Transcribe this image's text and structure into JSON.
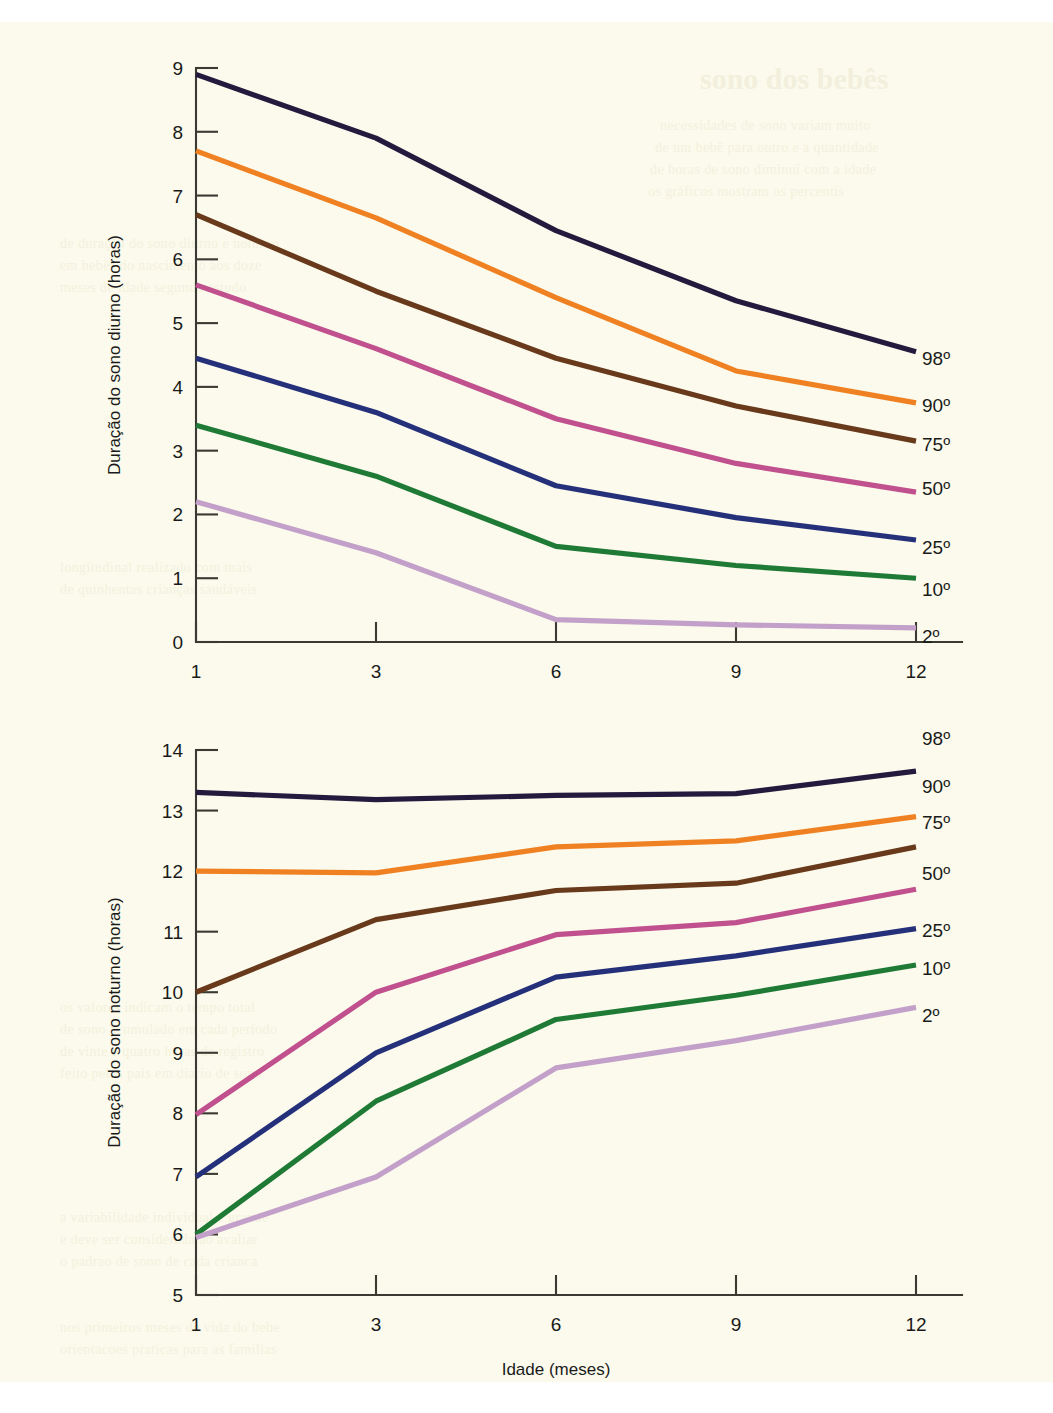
{
  "page": {
    "background_color": "#fbfaec",
    "ghost_text": [
      {
        "text": "sono dos bebês",
        "x": 700,
        "y": 62,
        "size": "big"
      },
      {
        "text": "necessidades de sono variam muito",
        "x": 660,
        "y": 118,
        "size": "body"
      },
      {
        "text": "de um bebê para outro e a quantidade",
        "x": 655,
        "y": 140,
        "size": "body"
      },
      {
        "text": "de horas de sono diminui com a idade",
        "x": 650,
        "y": 162,
        "size": "body"
      },
      {
        "text": "os gráficos mostram os percentis",
        "x": 648,
        "y": 184,
        "size": "body"
      },
      {
        "text": "de duração do sono diurno e noturno",
        "x": 60,
        "y": 236,
        "size": "body"
      },
      {
        "text": "em bebês do nascimento aos doze",
        "x": 60,
        "y": 258,
        "size": "body"
      },
      {
        "text": "meses de idade segundo estudo",
        "x": 60,
        "y": 280,
        "size": "body"
      },
      {
        "text": "longitudinal realizado com mais",
        "x": 60,
        "y": 560,
        "size": "body"
      },
      {
        "text": "de quinhentas crianças saudáveis",
        "x": 60,
        "y": 582,
        "size": "body"
      },
      {
        "text": "os valores indicam o tempo total",
        "x": 60,
        "y": 1000,
        "size": "body"
      },
      {
        "text": "de sono acumulado em cada período",
        "x": 60,
        "y": 1022,
        "size": "body"
      },
      {
        "text": "de vinte e quatro horas de registro",
        "x": 60,
        "y": 1044,
        "size": "body"
      },
      {
        "text": "feito pelos pais em diario de sono",
        "x": 60,
        "y": 1066,
        "size": "body"
      },
      {
        "text": "a variabilidade individual e grande",
        "x": 60,
        "y": 1210,
        "size": "body"
      },
      {
        "text": "e deve ser considerada ao avaliar",
        "x": 60,
        "y": 1232,
        "size": "body"
      },
      {
        "text": "o padrao de sono de cada crianca",
        "x": 60,
        "y": 1254,
        "size": "body"
      },
      {
        "text": "nos primeiros meses de vida do bebe",
        "x": 60,
        "y": 1320,
        "size": "body"
      },
      {
        "text": "orientacoes praticas para as familias",
        "x": 60,
        "y": 1342,
        "size": "body"
      }
    ]
  },
  "colors": {
    "p98": "#241a3e",
    "p90": "#ef8122",
    "p75": "#68391a",
    "p50": "#c0508e",
    "p25": "#25307a",
    "p10": "#1f7a36",
    "p2": "#c3a0c9",
    "axis": "#3a3a32",
    "text": "#1a1a1a"
  },
  "chart_data": [
    {
      "id": "sono-diurno",
      "type": "line",
      "title": "",
      "xlabel": "Idade (meses)",
      "ylabel": "Duração do sono diurno (horas)",
      "categories": [
        "1",
        "3",
        "6",
        "9",
        "12"
      ],
      "x": [
        1,
        3,
        6,
        9,
        12
      ],
      "xticklabels": [
        "1",
        "3",
        "6",
        "9",
        "12"
      ],
      "yticklabels": [
        "0",
        "1",
        "2",
        "3",
        "4",
        "5",
        "6",
        "7",
        "8",
        "9"
      ],
      "ylim": [
        0,
        9
      ],
      "xlim_categorical": true,
      "grid": false,
      "legend_position": "right-end-of-line",
      "series": [
        {
          "name": "98º",
          "color_key": "p98",
          "values": [
            8.9,
            7.9,
            6.45,
            5.35,
            4.55
          ]
        },
        {
          "name": "90º",
          "color_key": "p90",
          "values": [
            7.7,
            6.65,
            5.4,
            4.25,
            3.75
          ]
        },
        {
          "name": "75º",
          "color_key": "p75",
          "values": [
            6.7,
            5.5,
            4.45,
            3.7,
            3.15
          ]
        },
        {
          "name": "50º",
          "color_key": "p50",
          "values": [
            5.6,
            4.6,
            3.5,
            2.8,
            2.35
          ]
        },
        {
          "name": "25º",
          "color_key": "p25",
          "values": [
            4.45,
            3.6,
            2.45,
            1.95,
            1.6
          ]
        },
        {
          "name": "10º",
          "color_key": "p10",
          "values": [
            3.4,
            2.6,
            1.5,
            1.2,
            1.0
          ]
        },
        {
          "name": "2º",
          "color_key": "p2",
          "values": [
            2.2,
            1.4,
            0.35,
            0.27,
            0.22
          ]
        }
      ]
    },
    {
      "id": "sono-noturno",
      "type": "line",
      "title": "",
      "xlabel": "Idade (meses)",
      "ylabel": "Duração do sono noturno (horas)",
      "categories": [
        "1",
        "3",
        "6",
        "9",
        "12"
      ],
      "x": [
        1,
        3,
        6,
        9,
        12
      ],
      "xticklabels": [
        "1",
        "3",
        "6",
        "9",
        "12"
      ],
      "yticklabels": [
        "5",
        "6",
        "7",
        "8",
        "9",
        "10",
        "11",
        "12",
        "13",
        "14"
      ],
      "ylim": [
        5,
        14
      ],
      "xlim_categorical": true,
      "grid": false,
      "legend_position": "right-end-of-line",
      "series": [
        {
          "name": "98º",
          "color_key": "p98",
          "values": [
            13.3,
            13.18,
            13.25,
            13.28,
            13.65
          ]
        },
        {
          "name": "90º",
          "color_key": "p90",
          "values": [
            12.0,
            11.97,
            12.4,
            12.5,
            12.9
          ]
        },
        {
          "name": "75º",
          "color_key": "p75",
          "values": [
            10.0,
            11.2,
            11.68,
            11.8,
            12.4
          ]
        },
        {
          "name": "50º",
          "color_key": "p50",
          "values": [
            7.98,
            10.0,
            10.95,
            11.15,
            11.7
          ]
        },
        {
          "name": "25º",
          "color_key": "p25",
          "values": [
            6.95,
            9.0,
            10.25,
            10.6,
            11.05
          ]
        },
        {
          "name": "10º",
          "color_key": "p10",
          "values": [
            6.0,
            8.2,
            9.55,
            9.95,
            10.45
          ]
        },
        {
          "name": "2º",
          "color_key": "p2",
          "values": [
            5.95,
            6.95,
            8.75,
            9.2,
            9.75
          ]
        }
      ]
    }
  ]
}
